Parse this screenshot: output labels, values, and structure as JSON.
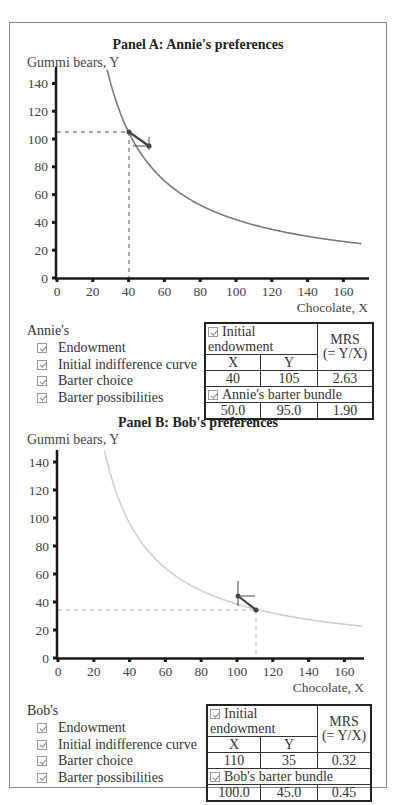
{
  "panel_a": {
    "title": "Panel A: Annie's preferences",
    "y_axis_label": "Gummi bears, Y",
    "x_axis_label": "Chocolate, X",
    "y_ticks": [
      "0",
      "20",
      "40",
      "60",
      "80",
      "100",
      "120",
      "140"
    ],
    "x_ticks": [
      "0",
      "20",
      "40",
      "60",
      "80",
      "100",
      "120",
      "140",
      "160"
    ],
    "legend": {
      "heading": "Annie's",
      "items": [
        {
          "label": "Endowment",
          "checked": true
        },
        {
          "label": "Initial indifference curve",
          "checked": true
        },
        {
          "label": "Barter choice",
          "checked": true
        },
        {
          "label": "Barter possibilities",
          "checked": true
        }
      ]
    },
    "table": {
      "endowment_header": "Initial endowment",
      "mrs_header_line1": "MRS",
      "mrs_header_line2": "(= Y/X)",
      "col_x": "X",
      "col_y": "Y",
      "endowment": {
        "x": "40",
        "y": "105",
        "mrs": "2.63"
      },
      "barter_header": "Annie's barter bundle",
      "barter": {
        "x": "50.0",
        "y": "95.0",
        "mrs": "1.90"
      }
    }
  },
  "panel_b": {
    "title": "Panel B: Bob's preferences",
    "y_axis_label": "Gummi bears, Y",
    "x_axis_label": "Chocolate, X",
    "y_ticks": [
      "0",
      "20",
      "40",
      "60",
      "80",
      "100",
      "120",
      "140"
    ],
    "x_ticks": [
      "0",
      "20",
      "40",
      "60",
      "80",
      "100",
      "120",
      "140",
      "160"
    ],
    "legend": {
      "heading": "Bob's",
      "items": [
        {
          "label": "Endowment",
          "checked": true
        },
        {
          "label": "Initial indifference curve",
          "checked": true
        },
        {
          "label": "Barter choice",
          "checked": true
        },
        {
          "label": "Barter possibilities",
          "checked": true
        }
      ]
    },
    "table": {
      "endowment_header": "Initial endowment",
      "mrs_header_line1": "MRS",
      "mrs_header_line2": "(= Y/X)",
      "col_x": "X",
      "col_y": "Y",
      "endowment": {
        "x": "110",
        "y": "35",
        "mrs": "0.32"
      },
      "barter_header": "Bob's barter bundle",
      "barter": {
        "x": "100.0",
        "y": "45.0",
        "mrs": "0.45"
      }
    }
  },
  "colors": {
    "annie_curve": "#7a7a7a",
    "bob_curve": "#cfcfcf",
    "axis": "#1a1a1a",
    "guide_dash": "#888888",
    "barter_line": "#444444"
  },
  "chart_data": [
    {
      "type": "line",
      "title": "Panel A: Annie's preferences",
      "xlabel": "Chocolate, X",
      "ylabel": "Gummi bears, Y",
      "xlim": [
        0,
        170
      ],
      "ylim": [
        0,
        150
      ],
      "x_ticks": [
        0,
        20,
        40,
        60,
        80,
        100,
        120,
        140,
        160
      ],
      "y_ticks": [
        0,
        20,
        40,
        60,
        80,
        100,
        120,
        140
      ],
      "series": [
        {
          "name": "Initial indifference curve",
          "formula": "Y = 4200 / X",
          "x": [
            28,
            30,
            35,
            40,
            50,
            60,
            80,
            100,
            120,
            140,
            160,
            170
          ],
          "y": [
            150,
            140,
            120,
            105,
            84,
            70,
            52.5,
            42,
            35,
            30,
            26.3,
            24.7
          ]
        },
        {
          "name": "Endowment",
          "x": [
            40
          ],
          "y": [
            105
          ]
        },
        {
          "name": "Barter choice",
          "x": [
            50
          ],
          "y": [
            95
          ]
        },
        {
          "name": "Barter possibilities",
          "x": [
            40,
            50
          ],
          "y": [
            105,
            95
          ]
        }
      ],
      "grid": false,
      "legend_position": "bottom-left"
    },
    {
      "type": "line",
      "title": "Panel B: Bob's preferences",
      "xlabel": "Chocolate, X",
      "ylabel": "Gummi bears, Y",
      "xlim": [
        0,
        170
      ],
      "ylim": [
        0,
        150
      ],
      "x_ticks": [
        0,
        20,
        40,
        60,
        80,
        100,
        120,
        140,
        160
      ],
      "y_ticks": [
        0,
        20,
        40,
        60,
        80,
        100,
        120,
        140
      ],
      "series": [
        {
          "name": "Initial indifference curve",
          "formula": "Y = 3850 / X",
          "x": [
            25.7,
            30,
            40,
            50,
            60,
            80,
            100,
            110,
            120,
            140,
            160,
            170
          ],
          "y": [
            150,
            128,
            96,
            77,
            64,
            48,
            38.5,
            35,
            32,
            27.5,
            24,
            22.6
          ]
        },
        {
          "name": "Endowment",
          "x": [
            110
          ],
          "y": [
            35
          ]
        },
        {
          "name": "Barter choice",
          "x": [
            100
          ],
          "y": [
            45
          ]
        },
        {
          "name": "Barter possibilities",
          "x": [
            110,
            100
          ],
          "y": [
            35,
            45
          ]
        }
      ],
      "grid": false,
      "legend_position": "bottom-left"
    }
  ]
}
